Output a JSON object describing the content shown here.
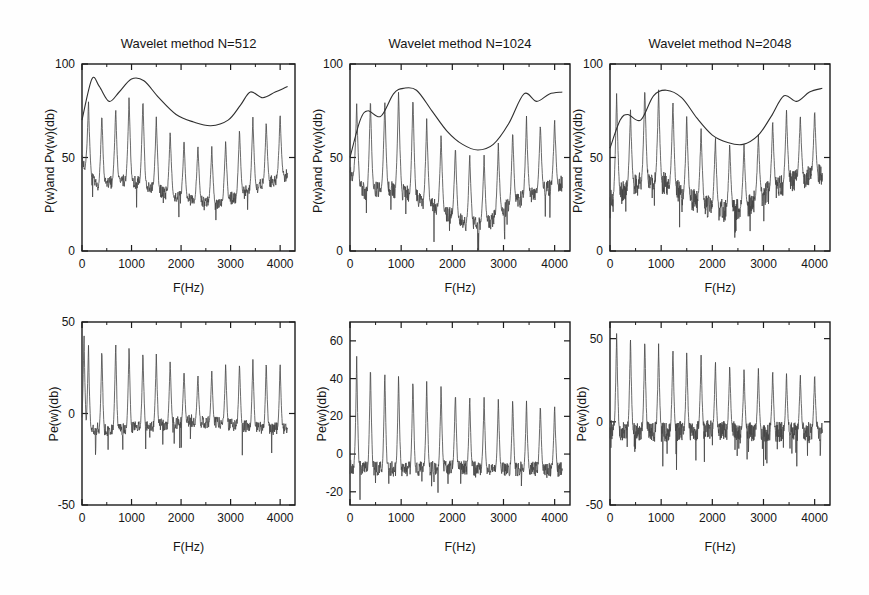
{
  "figure": {
    "description_colors": {
      "background": "#fefefe",
      "axis": "#1c1c1c",
      "trace": "#454545",
      "envelope": "#2f2f2f",
      "text": "#161616"
    }
  },
  "chart_data": [
    {
      "type": "line",
      "title": "Wavelet method N=512",
      "xlabel": "F(Hz)",
      "ylabel": "P(w)and Pv(w)(db)",
      "xlim": [
        0,
        4300
      ],
      "ylim": [
        0,
        100
      ],
      "xticks": [
        0,
        1000,
        2000,
        3000,
        4000
      ],
      "xminor": [
        500,
        1500,
        2500,
        3500
      ],
      "yticks": [
        0,
        50,
        100
      ],
      "grid": false,
      "legend": "none",
      "series": [
        {
          "name": "P(w) harmonic spectrum",
          "style": "spiky",
          "seed": 7,
          "peak_freqs": [
            130,
            400,
            680,
            950,
            1230,
            1500,
            1780,
            2060,
            2340,
            2620,
            2900,
            3180,
            3450,
            3720,
            4000
          ],
          "peak_heights": [
            80,
            74,
            77,
            83,
            82,
            72,
            64,
            60,
            57,
            56,
            60,
            66,
            72,
            70,
            74
          ],
          "peak_halfwidth": 70,
          "noise_amp": 3.5,
          "dip_prob": 0.02,
          "dip_depth": 9,
          "samples": 700,
          "floor_points": [
            [
              0,
              48
            ],
            [
              300,
              34
            ],
            [
              700,
              38
            ],
            [
              1100,
              37
            ],
            [
              1500,
              33
            ],
            [
              1900,
              29
            ],
            [
              2300,
              27
            ],
            [
              2700,
              25
            ],
            [
              3100,
              29
            ],
            [
              3500,
              34
            ],
            [
              4150,
              41
            ]
          ]
        },
        {
          "name": "Pv(w) smooth envelope",
          "style": "smooth",
          "points": [
            [
              0,
              70
            ],
            [
              200,
              92
            ],
            [
              350,
              88
            ],
            [
              550,
              80
            ],
            [
              750,
              85
            ],
            [
              1000,
              92
            ],
            [
              1250,
              91
            ],
            [
              1550,
              82
            ],
            [
              1900,
              73
            ],
            [
              2250,
              69
            ],
            [
              2600,
              67
            ],
            [
              2950,
              70
            ],
            [
              3200,
              78
            ],
            [
              3400,
              85
            ],
            [
              3650,
              82
            ],
            [
              3900,
              85
            ],
            [
              4150,
              88
            ]
          ]
        }
      ]
    },
    {
      "type": "line",
      "title": "Wavelet method N=1024",
      "xlabel": "F(Hz)",
      "ylabel": "P(w)and Pv(w)(db)",
      "xlim": [
        0,
        4300
      ],
      "ylim": [
        0,
        100
      ],
      "xticks": [
        0,
        1000,
        2000,
        3000,
        4000
      ],
      "xminor": [
        500,
        1500,
        2500,
        3500
      ],
      "yticks": [
        0,
        50,
        100
      ],
      "grid": false,
      "legend": "none",
      "series": [
        {
          "name": "P(w) harmonic spectrum",
          "style": "spiky",
          "seed": 11,
          "peak_freqs": [
            130,
            400,
            680,
            950,
            1230,
            1500,
            1780,
            2060,
            2340,
            2620,
            2900,
            3180,
            3450,
            3720,
            4000
          ],
          "peak_heights": [
            79,
            82,
            81,
            87,
            84,
            71,
            63,
            56,
            53,
            51,
            58,
            65,
            72,
            69,
            71
          ],
          "peak_halfwidth": 70,
          "noise_amp": 4.5,
          "dip_prob": 0.035,
          "dip_depth": 14,
          "samples": 700,
          "floor_points": [
            [
              0,
              42
            ],
            [
              300,
              31
            ],
            [
              700,
              34
            ],
            [
              1100,
              31
            ],
            [
              1500,
              26
            ],
            [
              1900,
              20
            ],
            [
              2300,
              14
            ],
            [
              2700,
              15
            ],
            [
              3100,
              24
            ],
            [
              3500,
              30
            ],
            [
              4150,
              36
            ]
          ]
        },
        {
          "name": "Pv(w) smooth envelope",
          "style": "smooth",
          "points": [
            [
              0,
              50
            ],
            [
              200,
              70
            ],
            [
              350,
              75
            ],
            [
              600,
              72
            ],
            [
              850,
              84
            ],
            [
              1050,
              87
            ],
            [
              1300,
              86
            ],
            [
              1600,
              75
            ],
            [
              1900,
              64
            ],
            [
              2200,
              57
            ],
            [
              2500,
              54
            ],
            [
              2800,
              57
            ],
            [
              3100,
              68
            ],
            [
              3400,
              84
            ],
            [
              3650,
              80
            ],
            [
              3900,
              84
            ],
            [
              4150,
              85
            ]
          ]
        }
      ]
    },
    {
      "type": "line",
      "title": "Wavelet method N=2048",
      "xlabel": "F(Hz)",
      "ylabel": "P(w)and Pv(w)(db)",
      "xlim": [
        0,
        4300
      ],
      "ylim": [
        0,
        100
      ],
      "xticks": [
        0,
        1000,
        2000,
        3000,
        4000
      ],
      "xminor": [
        500,
        1500,
        2500,
        3500
      ],
      "yticks": [
        0,
        50,
        100
      ],
      "grid": false,
      "legend": "none",
      "series": [
        {
          "name": "P(w) harmonic spectrum",
          "style": "spiky",
          "seed": 13,
          "peak_freqs": [
            130,
            400,
            680,
            950,
            1230,
            1500,
            1780,
            2060,
            2340,
            2620,
            2900,
            3180,
            3450,
            3720,
            4000
          ],
          "peak_heights": [
            85,
            76,
            88,
            87,
            81,
            73,
            66,
            61,
            58,
            57,
            63,
            70,
            76,
            73,
            76
          ],
          "peak_halfwidth": 70,
          "noise_amp": 6,
          "dip_prob": 0.05,
          "dip_depth": 10,
          "samples": 900,
          "floor_points": [
            [
              0,
              28
            ],
            [
              300,
              32
            ],
            [
              700,
              38
            ],
            [
              1100,
              36
            ],
            [
              1500,
              29
            ],
            [
              1900,
              24
            ],
            [
              2300,
              21
            ],
            [
              2700,
              24
            ],
            [
              3100,
              32
            ],
            [
              3500,
              37
            ],
            [
              4150,
              41
            ]
          ]
        },
        {
          "name": "Pv(w) smooth envelope",
          "style": "smooth",
          "points": [
            [
              0,
              55
            ],
            [
              200,
              70
            ],
            [
              350,
              73
            ],
            [
              600,
              70
            ],
            [
              850,
              83
            ],
            [
              1100,
              86
            ],
            [
              1400,
              82
            ],
            [
              1700,
              71
            ],
            [
              2000,
              62
            ],
            [
              2300,
              58
            ],
            [
              2600,
              57
            ],
            [
              2900,
              62
            ],
            [
              3150,
              72
            ],
            [
              3400,
              83
            ],
            [
              3650,
              80
            ],
            [
              3900,
              85
            ],
            [
              4150,
              87
            ]
          ]
        }
      ]
    },
    {
      "type": "line",
      "title": "",
      "xlabel": "F(Hz)",
      "ylabel": "Pe(w)(db)",
      "xlim": [
        0,
        4300
      ],
      "ylim": [
        -50,
        50
      ],
      "xticks": [
        0,
        1000,
        2000,
        3000,
        4000
      ],
      "xminor": [
        500,
        1500,
        2500,
        3500
      ],
      "yticks": [
        -50,
        0,
        50
      ],
      "grid": false,
      "legend": "none",
      "series": [
        {
          "name": "Pe(w) error spectrum",
          "style": "spiky",
          "seed": 17,
          "peak_freqs": [
            40,
            130,
            400,
            680,
            950,
            1230,
            1500,
            1780,
            2060,
            2340,
            2620,
            2900,
            3180,
            3450,
            3720,
            4000
          ],
          "peak_heights": [
            45,
            38,
            36,
            40,
            38,
            35,
            33,
            30,
            25,
            22,
            24,
            28,
            29,
            30,
            29,
            28
          ],
          "peak_halfwidth": 55,
          "noise_amp": 3.5,
          "dip_prob": 0.03,
          "dip_depth": 10,
          "samples": 700,
          "floor_points": [
            [
              0,
              -8
            ],
            [
              600,
              -9
            ],
            [
              1400,
              -7
            ],
            [
              2200,
              -4
            ],
            [
              3000,
              -6
            ],
            [
              4150,
              -9
            ]
          ]
        }
      ]
    },
    {
      "type": "line",
      "title": "",
      "xlabel": "F(Hz)",
      "ylabel": "Pe(w)(db)",
      "xlim": [
        0,
        4300
      ],
      "ylim": [
        -27,
        70
      ],
      "xticks": [
        0,
        1000,
        2000,
        3000,
        4000
      ],
      "xminor": [
        500,
        1500,
        2500,
        3500
      ],
      "yticks": [
        -20,
        0,
        20,
        40,
        60
      ],
      "grid": false,
      "legend": "none",
      "series": [
        {
          "name": "Pe(w) error spectrum",
          "style": "spiky",
          "seed": 19,
          "peak_freqs": [
            130,
            400,
            680,
            950,
            1230,
            1500,
            1780,
            2060,
            2340,
            2620,
            2900,
            3180,
            3450,
            3720,
            4000
          ],
          "peak_heights": [
            52,
            48,
            45,
            43,
            41,
            39,
            37,
            34,
            32,
            31,
            30,
            30,
            29,
            28,
            27
          ],
          "peak_halfwidth": 55,
          "noise_amp": 4,
          "dip_prob": 0.04,
          "dip_depth": 10,
          "samples": 700,
          "floor_points": [
            [
              0,
              -7
            ],
            [
              1000,
              -8
            ],
            [
              2000,
              -7
            ],
            [
              3000,
              -8
            ],
            [
              4150,
              -8
            ]
          ]
        }
      ]
    },
    {
      "type": "line",
      "title": "",
      "xlabel": "F(Hz)",
      "ylabel": "Pe(w)(db)",
      "xlim": [
        0,
        4300
      ],
      "ylim": [
        -50,
        60
      ],
      "xticks": [
        0,
        1000,
        2000,
        3000,
        4000
      ],
      "xminor": [
        500,
        1500,
        2500,
        3500
      ],
      "yticks": [
        -50,
        0,
        50
      ],
      "grid": false,
      "legend": "none",
      "series": [
        {
          "name": "Pe(w) error spectrum",
          "style": "spiky",
          "seed": 23,
          "peak_freqs": [
            130,
            400,
            680,
            950,
            1230,
            1500,
            1780,
            2060,
            2340,
            2620,
            2900,
            3180,
            3450,
            3720,
            4000
          ],
          "peak_heights": [
            55,
            52,
            50,
            47,
            45,
            43,
            40,
            37,
            35,
            33,
            33,
            31,
            30,
            29,
            30
          ],
          "peak_halfwidth": 55,
          "noise_amp": 6,
          "dip_prob": 0.05,
          "dip_depth": 12,
          "samples": 900,
          "floor_points": [
            [
              0,
              -5
            ],
            [
              1000,
              -6
            ],
            [
              2000,
              -5
            ],
            [
              3000,
              -6
            ],
            [
              4150,
              -6
            ]
          ]
        }
      ]
    }
  ]
}
